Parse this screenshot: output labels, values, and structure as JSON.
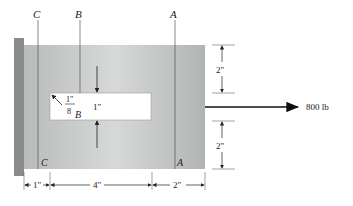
{
  "diagram": {
    "section_labels": {
      "c_top": "C",
      "b_top": "B",
      "a_top": "A",
      "c_bottom": "C",
      "b_bottom": "B",
      "a_bottom": "A"
    },
    "dimensions": {
      "slot_height": "1\"",
      "fillet_radius_num": "1\"",
      "fillet_radius_den": "8",
      "top_right": "2\"",
      "bottom_right": "2\"",
      "bottom_1": "1\"",
      "bottom_4": "4\"",
      "bottom_2": "2\""
    },
    "force": {
      "label": "800 lb"
    },
    "colors": {
      "plate": "#c4c6c6",
      "wall": "#8a8c8c",
      "slot": "#ffffff"
    }
  }
}
